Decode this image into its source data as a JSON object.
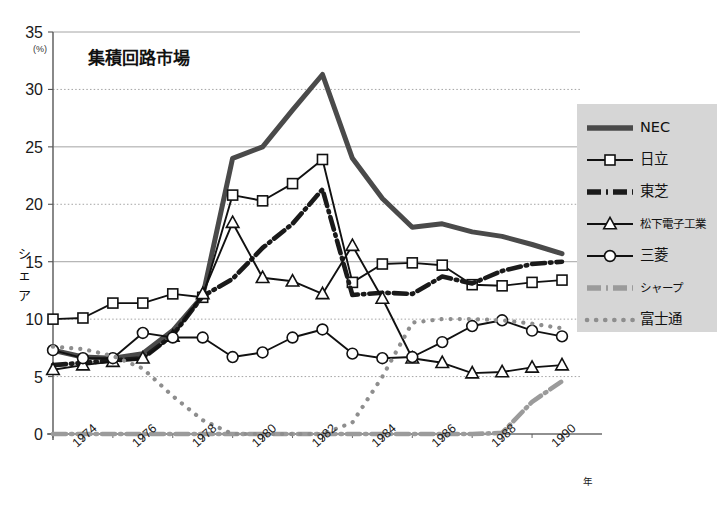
{
  "chart_data": {
    "type": "line",
    "title": "集積回路市場",
    "xlabel": "年",
    "ylabel": "シェア",
    "y_unit": "(%)",
    "ylim": [
      0,
      35
    ],
    "yticks": [
      0,
      5,
      10,
      15,
      20,
      25,
      30,
      35
    ],
    "xlim": [
      1973,
      1990
    ],
    "xticks": [
      1974,
      1976,
      1978,
      1980,
      1982,
      1984,
      1986,
      1988,
      1990
    ],
    "x": [
      1973,
      1974,
      1975,
      1976,
      1977,
      1978,
      1979,
      1980,
      1981,
      1982,
      1983,
      1984,
      1985,
      1986,
      1987,
      1988,
      1989,
      1990
    ],
    "grid": "horizontal",
    "legend_position": "right",
    "series": [
      {
        "name": "NEC",
        "style": "thick-solid",
        "color": "#4a4a4a",
        "values": [
          7.3,
          6.7,
          6.6,
          7.0,
          9.0,
          12.0,
          24.0,
          25.0,
          28.2,
          31.3,
          24.0,
          20.5,
          18.0,
          18.3,
          17.6,
          17.2,
          16.5,
          15.7
        ]
      },
      {
        "name": "日立",
        "style": "solid-square",
        "color": "#111111",
        "values": [
          10.0,
          10.1,
          11.4,
          11.4,
          12.2,
          11.9,
          20.8,
          20.3,
          21.8,
          23.9,
          13.2,
          14.8,
          14.9,
          14.7,
          13.0,
          12.9,
          13.2,
          13.4
        ]
      },
      {
        "name": "東芝",
        "style": "thick-dashdot",
        "color": "#1a1a1a",
        "values": [
          6.0,
          6.2,
          6.4,
          6.6,
          8.6,
          12.0,
          13.5,
          16.2,
          18.3,
          21.3,
          12.1,
          12.3,
          12.2,
          13.7,
          13.1,
          14.2,
          14.8,
          15.0
        ]
      },
      {
        "name": "松下電子工業",
        "style": "solid-triangle",
        "color": "#111111",
        "values": [
          5.6,
          6.0,
          6.3,
          6.6,
          8.5,
          12.2,
          18.4,
          13.6,
          13.3,
          12.2,
          16.4,
          11.8,
          6.6,
          6.2,
          5.3,
          5.4,
          5.8,
          6.0
        ]
      },
      {
        "name": "三菱",
        "style": "solid-circle",
        "color": "#111111",
        "values": [
          7.3,
          6.6,
          6.6,
          8.8,
          8.4,
          8.4,
          6.7,
          7.1,
          8.4,
          9.1,
          7.0,
          6.6,
          6.7,
          8.0,
          9.4,
          9.9,
          9.0,
          8.5
        ]
      },
      {
        "name": "シャープ",
        "style": "thick-dashdot-gray",
        "color": "#9b9b9b",
        "values": [
          0,
          0,
          0,
          0,
          0,
          0,
          0,
          0,
          0,
          0,
          0,
          0,
          0,
          0,
          0,
          0.1,
          2.8,
          4.6
        ]
      },
      {
        "name": "富士通",
        "style": "dotted-gray",
        "color": "#8e8e8e",
        "values": [
          7.6,
          7.4,
          6.8,
          5.7,
          3.3,
          1.2,
          0,
          0,
          0,
          0,
          1.0,
          5.0,
          9.7,
          10.0,
          10.0,
          9.9,
          9.6,
          9.2
        ]
      }
    ]
  },
  "legend": {
    "items": [
      {
        "label": "NEC",
        "icon": "thick-solid-swatch"
      },
      {
        "label": "日立",
        "icon": "line-square-swatch"
      },
      {
        "label": "東芝",
        "icon": "thick-dashdot-swatch"
      },
      {
        "label": "松下電子工業",
        "icon": "line-triangle-swatch"
      },
      {
        "label": "三菱",
        "icon": "line-circle-swatch"
      },
      {
        "label": "シャープ",
        "icon": "gray-dashdot-swatch"
      },
      {
        "label": "富士通",
        "icon": "gray-dotted-swatch"
      }
    ]
  },
  "axis_text": {
    "y_unit": "(%)",
    "y_title_chars": [
      "シ",
      "ェ",
      "ア"
    ],
    "x_unit": "年"
  }
}
